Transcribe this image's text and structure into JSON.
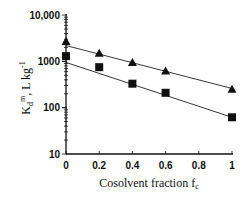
{
  "chart_data": {
    "type": "scatter",
    "title": "",
    "xlabel": "Cosolvent fraction f_c",
    "xlabel_main": "Cosolvent  fraction f",
    "xlabel_sub": "c",
    "ylabel": "Kd^m, L kg^-1",
    "ylabel_parts": {
      "k": "K",
      "sub": "d",
      "sup": "m",
      "rest": ", L kg",
      "sup2": "-1"
    },
    "yscale": "log",
    "xlim": [
      0,
      1
    ],
    "ylim": [
      10,
      10000
    ],
    "xticks": [
      "0",
      "0.2",
      "0.4",
      "0.6",
      "0.8",
      "1"
    ],
    "yticks": [
      "10",
      "100",
      "1000",
      "10,000"
    ],
    "grid": false,
    "legend": null,
    "series": [
      {
        "name": "triangles",
        "marker": "triangle",
        "x": [
          0,
          0.2,
          0.4,
          0.6,
          1
        ],
        "y": [
          2700,
          1500,
          950,
          620,
          250
        ],
        "fit": {
          "y0": 2200,
          "y1": 260
        }
      },
      {
        "name": "squares",
        "marker": "square",
        "x": [
          0,
          0.2,
          0.4,
          0.6,
          1
        ],
        "y": [
          1300,
          750,
          330,
          210,
          62
        ],
        "fit": {
          "y0": 950,
          "y1": 62
        }
      }
    ]
  }
}
